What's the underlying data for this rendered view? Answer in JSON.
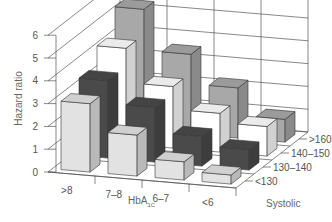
{
  "chart_data": {
    "type": "bar3d",
    "title": "",
    "ylabel": "Hazard ratio",
    "xlabel": "HbA1c",
    "xlabel_main": "HbA",
    "xlabel_sub": "1C",
    "zlabel": "Systolic",
    "ylim": [
      0,
      6
    ],
    "yticks": [
      "0",
      "1",
      "2",
      "3",
      "4",
      "5",
      "6"
    ],
    "categories": [
      ">8",
      "7–8",
      "6–7",
      "<6"
    ],
    "series": [
      {
        "name": "<130",
        "color": "#e2e2e2",
        "values": [
          3.0,
          1.8,
          0.8,
          0.4
        ]
      },
      {
        "name": "130–140",
        "color": "#4a4a4a",
        "values": [
          3.4,
          2.4,
          1.3,
          0.9
        ]
      },
      {
        "name": "140–150",
        "color": "#ffffff",
        "values": [
          4.2,
          2.7,
          1.7,
          1.3
        ]
      },
      {
        "name": ">160",
        "color": "#a8a8a8",
        "values": [
          5.3,
          3.5,
          2.2,
          1.0
        ]
      }
    ],
    "zticks": [
      "<130",
      "130–140",
      "140–150",
      ">160"
    ],
    "grid": true
  }
}
